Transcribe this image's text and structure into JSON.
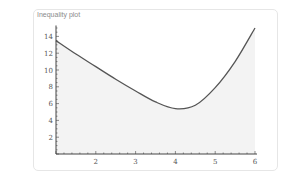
{
  "title": "Inequality plot",
  "chart_data": {
    "type": "area",
    "title": "Inequality plot",
    "xlabel": "",
    "ylabel": "",
    "xlim": [
      1,
      6
    ],
    "ylim": [
      0,
      15
    ],
    "x_ticks": [
      2,
      3,
      4,
      5,
      6
    ],
    "y_ticks": [
      2,
      4,
      6,
      8,
      10,
      12,
      14
    ],
    "grid": false,
    "legend": "none",
    "series": [
      {
        "name": "boundary",
        "x": [
          1,
          1.5,
          2,
          2.5,
          3,
          3.5,
          4,
          4.5,
          5,
          5.5,
          6
        ],
        "y": [
          13.5,
          11.9,
          10.4,
          8.9,
          7.5,
          6.2,
          5.4,
          5.8,
          7.9,
          11.0,
          15.0
        ]
      }
    ],
    "shaded_region": "below curve",
    "fill_color": "#f3f3f3",
    "line_color": "#555555"
  }
}
